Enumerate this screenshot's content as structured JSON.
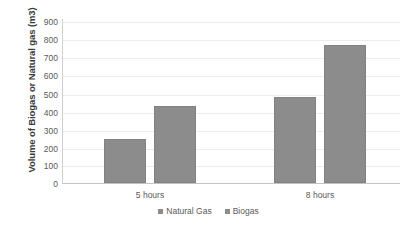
{
  "chart_data": {
    "type": "bar",
    "title": "",
    "xlabel": "",
    "ylabel": "Volume of Biogas or Natural gas (m3)",
    "categories": [
      "5 hours",
      "8 hours"
    ],
    "series": [
      {
        "name": "Natural Gas",
        "values": [
          240,
          470
        ],
        "color": "#8C8C8C"
      },
      {
        "name": "Biogas",
        "values": [
          420,
          760
        ],
        "color": "#8C8C8C"
      }
    ],
    "ylim": [
      0,
      900
    ],
    "ytick_labels": [
      "900",
      "800",
      "700",
      "600",
      "500",
      "400",
      "300",
      "200",
      "100",
      "0"
    ],
    "ytick_values": [
      900,
      800,
      700,
      600,
      500,
      400,
      300,
      200,
      100,
      0
    ],
    "grid": true,
    "legend_position": "bottom",
    "legend_entries": [
      "Natural Gas",
      "Biogas"
    ],
    "background_color": "#FFFFFF",
    "gridline_color": "#ECECEC",
    "text_color": "#5A5A5A"
  }
}
